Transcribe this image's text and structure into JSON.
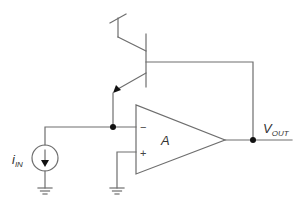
{
  "diagram": {
    "type": "circuit-schematic",
    "title": "",
    "components": {
      "transistor": {
        "type": "BJT-npn",
        "role": "feedback transistor"
      },
      "opamp": {
        "gain_label": "A",
        "inverting_sign": "−",
        "noninverting_sign": "+"
      },
      "current_source": {
        "label_main": "i",
        "label_sub": "IN",
        "direction": "down"
      },
      "output": {
        "label_main": "V",
        "label_sub": "OUT"
      }
    },
    "grounds": 2,
    "nodes": 2,
    "colors": {
      "wire": "#6e6e6e",
      "node": "#111111",
      "text": "#333333"
    }
  }
}
